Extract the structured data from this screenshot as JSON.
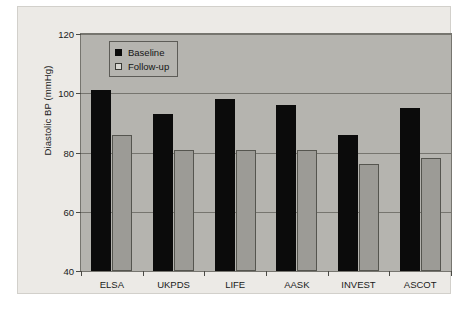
{
  "chart_data": {
    "type": "bar",
    "title": "",
    "subtitle": "",
    "xlabel": "",
    "ylabel": "Diastolic BP (mmHg)",
    "ylim": [
      40,
      120
    ],
    "yticks": [
      40,
      60,
      80,
      100,
      120
    ],
    "ytick_labels": [
      "40",
      "60",
      "80",
      "100",
      "120"
    ],
    "grid": true,
    "legend_position": "top-left-inside",
    "categories": [
      "ELSA",
      "UKPDS",
      "LIFE",
      "AASK",
      "INVEST",
      "ASCOT"
    ],
    "series": [
      {
        "name": "Baseline",
        "color": "#0b0b0b",
        "values": [
          101,
          93,
          98,
          96,
          86,
          95
        ]
      },
      {
        "name": "Follow-up",
        "color": "#9c9b96",
        "values": [
          86,
          81,
          81,
          81,
          76,
          78
        ]
      }
    ]
  },
  "legend": {
    "items": [
      {
        "label": "Baseline"
      },
      {
        "label": "Follow-up"
      }
    ]
  },
  "colors": {
    "figure_background": "#ffffff",
    "panel_background": "#eceae6",
    "plot_background": "#b5b4af",
    "axis_line": "#76756f",
    "baseline_bar": "#0b0b0b",
    "followup_bar": "#9c9b96",
    "followup_bar_edge": "#55554f",
    "text": "#1a1a1a"
  }
}
